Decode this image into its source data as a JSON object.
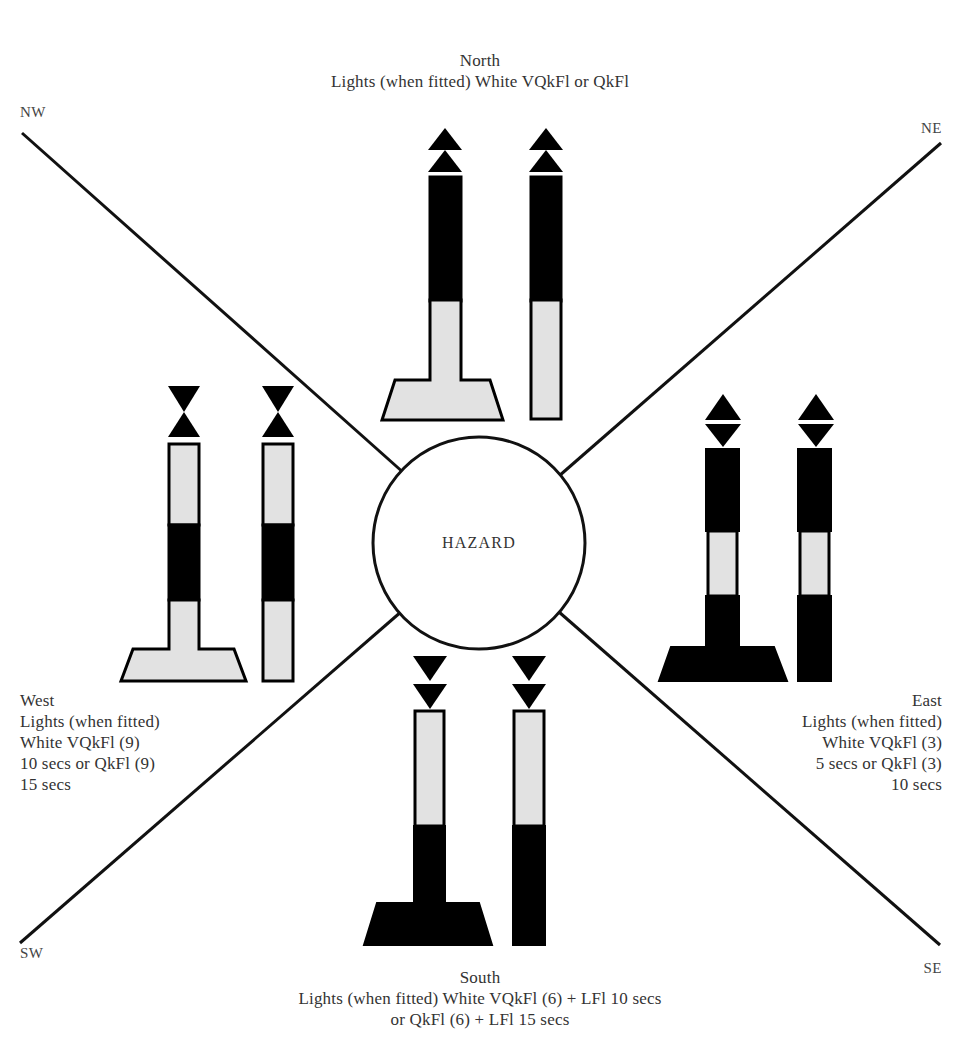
{
  "diagram": {
    "center_label": "HAZARD",
    "corners": {
      "nw": "NW",
      "ne": "NE",
      "sw": "SW",
      "se": "SE"
    },
    "north": {
      "heading": "North",
      "lines": [
        "Lights (when fitted) White VQkFl or QkFl"
      ],
      "topmark": "two cones points up",
      "colors": "black over yellow"
    },
    "south": {
      "heading": "South",
      "lines": [
        "Lights (when fitted) White VQkFl (6) + LFl 10 secs",
        "or QkFl (6) + LFl 15 secs"
      ],
      "topmark": "two cones points down",
      "colors": "yellow over black"
    },
    "east": {
      "heading": "East",
      "lines": [
        "Lights (when fitted)",
        "White VQkFl (3)",
        "5 secs or QkFl (3)",
        "10 secs"
      ],
      "topmark": "two cones base to base",
      "colors": "black with yellow band"
    },
    "west": {
      "heading": "West",
      "lines": [
        "Lights (when fitted)",
        "White VQkFl (9)",
        "10 secs or QkFl (9)",
        "15 secs"
      ],
      "topmark": "two cones point to point",
      "colors": "yellow with black band"
    },
    "colors": {
      "black": "#000000",
      "light": "#e2e2e2",
      "line": "#111111",
      "background": "#ffffff"
    }
  }
}
